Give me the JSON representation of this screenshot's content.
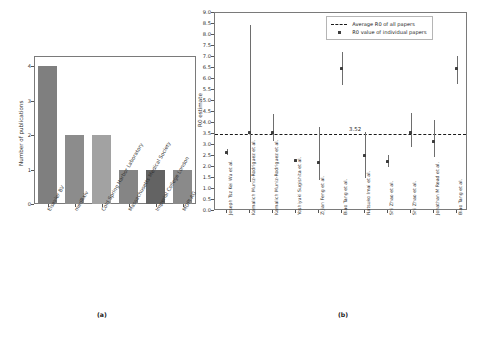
{
  "figure": {
    "panel_a_caption": "(a)",
    "panel_b_caption": "(b)"
  },
  "chart_data": [
    {
      "type": "bar",
      "panel": "(a)",
      "title": "",
      "xlabel": "",
      "ylabel": "Number of publications",
      "ylim": [
        0,
        4.3
      ],
      "yticks": [
        "0",
        "1",
        "2",
        "3",
        "4"
      ],
      "grid": false,
      "categories": [
        "Elsevier BV",
        "medRxiv",
        "Cold Spring Harbor Laboratory",
        "Massachusetts Medical Society",
        "Imperial College London",
        "MDPI AG"
      ],
      "values": [
        4,
        2,
        2,
        1,
        1,
        1
      ],
      "bar_colors": [
        "#7f7f7f",
        "#8c8c8c",
        "#a2a2a2",
        "#858585",
        "#636363",
        "#8a8a8a"
      ]
    },
    {
      "type": "scatter",
      "panel": "(b)",
      "title": "",
      "xlabel": "",
      "ylabel": "R0 estimate",
      "ylim": [
        0.0,
        9.0
      ],
      "yticks": [
        "0.0",
        "0.5",
        "1.0",
        "1.5",
        "2.0",
        "2.5",
        "3.0",
        "3.5",
        "4.0",
        "4.5",
        "5.0",
        "5.5",
        "6.0",
        "6.5",
        "7.0",
        "7.5",
        "8.0",
        "8.5",
        "9.0"
      ],
      "grid": false,
      "legend_position": "upper right",
      "legend": [
        "Average R0 of all papers",
        "R0 value of individual papers"
      ],
      "average_line": {
        "value": 3.52,
        "label": "3.52",
        "style": "dashed",
        "color": "#1a1a1a"
      },
      "categories": [
        "Joseph Tsz Kei Wu et al.",
        "Kamalich Muniz-Rodriguez et al.",
        "Kamalich Muniz-Rodriguez et al.",
        "Yoshiyuki Sugishita et al.",
        "Zijian Feng et al.",
        "Biao Tang et al.",
        "Natsuko Imai et al.",
        "Shi Zhao et al.",
        "Shi Zhao et al.",
        "Jonathan M Read et al.",
        "Biao Tang et al."
      ],
      "values": [
        2.68,
        3.58,
        3.58,
        2.3,
        2.22,
        6.47,
        2.51,
        2.26,
        3.58,
        3.15,
        6.49
      ],
      "ci_lower": [
        2.54,
        1.3,
        3.2,
        2.3,
        1.4,
        5.71,
        1.5,
        2.0,
        2.9,
        2.45,
        5.75
      ],
      "ci_upper": [
        2.82,
        8.45,
        4.4,
        2.3,
        3.8,
        7.23,
        3.58,
        2.55,
        4.45,
        4.15,
        7.05
      ],
      "marker_color": "#3d3d3d",
      "errorbar_color": "#6e6e6e"
    }
  ]
}
